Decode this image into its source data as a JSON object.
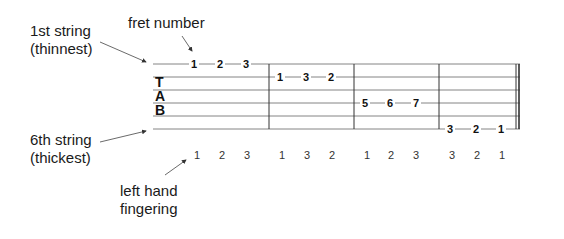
{
  "annotations": {
    "fret_number": "fret number",
    "first_string_line1": "1st string",
    "first_string_line2": "(thinnest)",
    "sixth_string_line1": "6th string",
    "sixth_string_line2": "(thickest)",
    "left_hand_line1": "left hand",
    "left_hand_line2": "fingering"
  },
  "tab_clef": [
    "T",
    "A",
    "B"
  ],
  "measures": [
    {
      "string": 1,
      "frets": [
        "1",
        "2",
        "3"
      ],
      "fingering": [
        "1",
        "2",
        "3"
      ]
    },
    {
      "string": 2,
      "frets": [
        "1",
        "3",
        "2"
      ],
      "fingering": [
        "1",
        "3",
        "2"
      ]
    },
    {
      "string": 4,
      "frets": [
        "5",
        "6",
        "7"
      ],
      "fingering": [
        "1",
        "2",
        "3"
      ]
    },
    {
      "string": 6,
      "frets": [
        "3",
        "2",
        "1"
      ],
      "fingering": [
        "3",
        "2",
        "1"
      ]
    }
  ]
}
